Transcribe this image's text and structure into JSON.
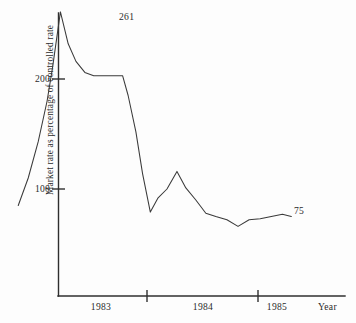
{
  "chart_data": {
    "type": "line",
    "title": "",
    "xlabel": "Year",
    "ylabel": "Market rate as percentage of controlled rate",
    "xlim": [
      1982.75,
      1985.6
    ],
    "ylim": [
      0,
      280
    ],
    "grid": false,
    "legend": null,
    "yticks": [
      100,
      200
    ],
    "ytick_labels": [
      "100",
      "200"
    ],
    "xticks": [
      1984,
      1985
    ],
    "xtick_labels": [
      "1983",
      "1984",
      "1985"
    ],
    "xtick_label_positions": [
      1983.42,
      1984.5,
      1985.17
    ],
    "annotations": [
      {
        "text": "261",
        "x": 1983.18,
        "y": 261,
        "note": "peak value label"
      },
      {
        "text": "75",
        "x": 1985.45,
        "y": 75,
        "note": "end value label"
      }
    ],
    "series": [
      {
        "name": "Market rate as percentage of controlled rate",
        "color": "#3a3a3a",
        "x": [
          1982.84,
          1982.93,
          1983.02,
          1983.1,
          1983.15,
          1983.22,
          1983.29,
          1983.36,
          1983.44,
          1983.52,
          1983.61,
          1983.7,
          1983.78,
          1983.83,
          1983.9,
          1983.96,
          1984.03,
          1984.1,
          1984.18,
          1984.27,
          1984.35,
          1984.44,
          1984.53,
          1984.62,
          1984.72,
          1984.82,
          1984.92,
          1985.02,
          1985.12,
          1985.22,
          1985.3
        ],
        "y": [
          85,
          110,
          143,
          180,
          211,
          261,
          232,
          216,
          206,
          203,
          203,
          203,
          203,
          185,
          152,
          114,
          79,
          92,
          100,
          116,
          101,
          90,
          78,
          75,
          72,
          66,
          72,
          73,
          75,
          77,
          75
        ],
        "values_note": "values read as market rate percentage of controlled rate"
      }
    ]
  },
  "axes": {
    "y_axis_name": "y-axis",
    "x_axis_name": "x-axis"
  }
}
